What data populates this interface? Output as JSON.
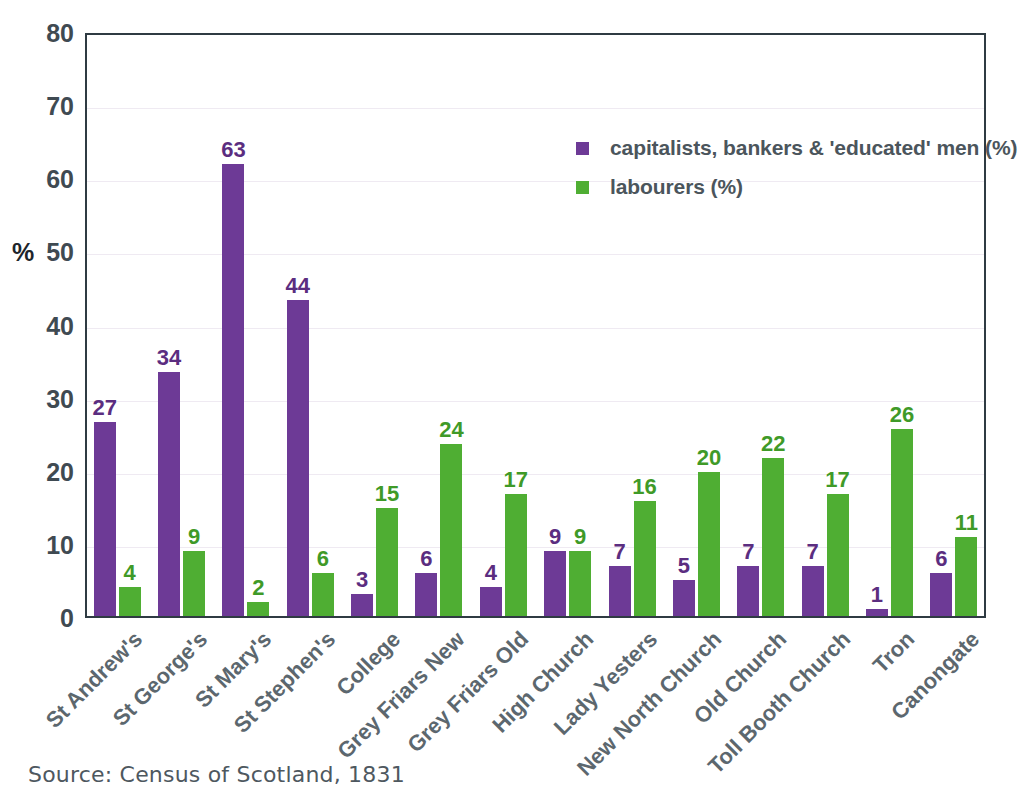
{
  "chart_data": {
    "type": "bar",
    "title": "",
    "xlabel": "",
    "ylabel": "%",
    "ylim": [
      0,
      80
    ],
    "yticks": [
      "0",
      "10",
      "20",
      "30",
      "40",
      "50",
      "60",
      "70",
      "80"
    ],
    "grid": true,
    "legend_position": "inside-top-center",
    "categories": [
      "St Andrew's",
      "St George's",
      "St Mary's",
      "St Stephen's",
      "College",
      "Grey Friars New",
      "Grey Friars Old",
      "High Church",
      "Lady Yesters",
      "New North Church",
      "Old Church",
      "Toll Booth Church",
      "Tron",
      "Canongate"
    ],
    "series": [
      {
        "name": "capitalists, bankers & 'educated' men (%)",
        "color": "#6d3a96",
        "values": [
          27,
          34,
          63,
          44,
          3,
          6,
          4,
          9,
          7,
          5,
          7,
          7,
          1,
          6
        ]
      },
      {
        "name": "labourers (%)",
        "color": "#4fae33",
        "values": [
          4,
          9,
          2,
          6,
          15,
          24,
          17,
          9,
          16,
          20,
          22,
          17,
          26,
          11
        ]
      }
    ],
    "source_note": "Source: Census of Scotland, 1831"
  },
  "colors": {
    "purple": "#6d3a96",
    "green": "#4fae33",
    "purple_label": "#5b2d80",
    "green_label": "#3f9a28",
    "axis_text": "#3f4a52",
    "category_text": "#5c676e",
    "legend_text": "#4b555c",
    "frame": "#2f3b43",
    "gridline": "#efeaf2"
  }
}
